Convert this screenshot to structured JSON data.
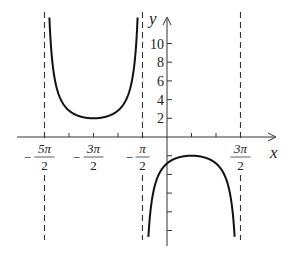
{
  "chart_data": {
    "type": "line",
    "title": "",
    "xlabel": "x",
    "ylabel": "y",
    "function": "y = -2 sec((x - π/2)/2)",
    "x_tick_labels": [
      {
        "value": -7.854,
        "num": "5π",
        "den": "2",
        "sign": "−"
      },
      {
        "value": -4.712,
        "num": "3π",
        "den": "2",
        "sign": "−"
      },
      {
        "value": -1.571,
        "num": "π",
        "den": "2",
        "sign": "−"
      },
      {
        "value": 4.712,
        "num": "3π",
        "den": "2",
        "sign": ""
      }
    ],
    "y_tick_labels": [
      "2",
      "4",
      "6",
      "8",
      "10"
    ],
    "y_tick_values": [
      2,
      4,
      6,
      8,
      10
    ],
    "asymptotes": [
      -7.854,
      -1.571,
      4.712
    ],
    "branches": [
      {
        "name": "upper",
        "center": -4.712,
        "extremum": 2,
        "x_range": [
          -7.854,
          -1.571
        ]
      },
      {
        "name": "lower",
        "center": 1.571,
        "extremum": -2,
        "x_range": [
          -1.571,
          4.712
        ]
      }
    ],
    "xlim": [
      -9.5,
      6.5
    ],
    "ylim": [
      -12,
      11.5
    ],
    "grid": false,
    "legend": null
  }
}
